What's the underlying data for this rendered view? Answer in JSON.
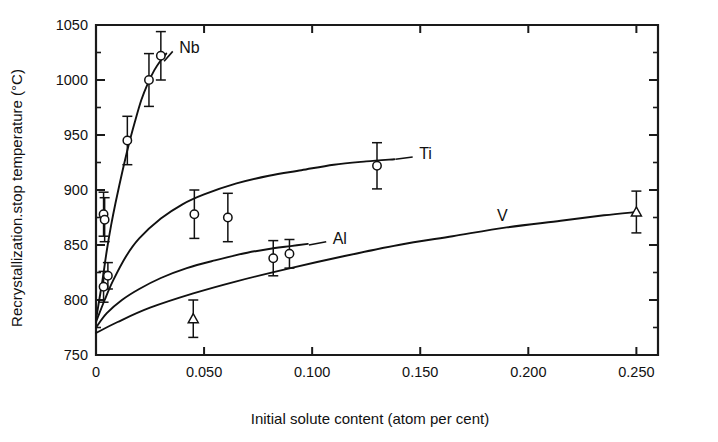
{
  "chart_data": {
    "type": "scatter",
    "title": "",
    "xlabel": "Initial solute content (atom per cent)",
    "ylabel": "Recrystallization.stop temperature (°C)",
    "xlim": [
      0,
      0.26
    ],
    "ylim": [
      750,
      1050
    ],
    "xticks": [
      0,
      0.05,
      0.1,
      0.15,
      0.2,
      0.25
    ],
    "xticklabels": [
      "0",
      "0.050",
      "0.100",
      "0.150",
      "0.200",
      "0.250"
    ],
    "yticks": [
      750,
      800,
      850,
      900,
      950,
      1000,
      1050
    ],
    "yticklabels": [
      "750",
      "800",
      "850",
      "900",
      "950",
      "1000",
      "1050"
    ],
    "grid": false,
    "legend_position": "inline-curve-labels",
    "series": [
      {
        "name": "Nb",
        "marker": "circle",
        "label_x": 0.0385,
        "label_y": 1030,
        "leader": [
          [
            0.0355,
            1026
          ],
          [
            0.0315,
            1017
          ]
        ],
        "curve": [
          [
            0.0,
            782
          ],
          [
            0.0015,
            800
          ],
          [
            0.003,
            818
          ],
          [
            0.005,
            845
          ],
          [
            0.007,
            868
          ],
          [
            0.009,
            888
          ],
          [
            0.012,
            915
          ],
          [
            0.015,
            940
          ],
          [
            0.018,
            962
          ],
          [
            0.021,
            982
          ],
          [
            0.024,
            997
          ],
          [
            0.027,
            1009
          ],
          [
            0.03,
            1018
          ],
          [
            0.0325,
            1024
          ]
        ],
        "points": [
          {
            "x": 0.0035,
            "y": 812,
            "err": 14
          },
          {
            "x": 0.0055,
            "y": 822,
            "err": 12
          },
          {
            "x": 0.0145,
            "y": 945,
            "err": 22
          },
          {
            "x": 0.0245,
            "y": 1000,
            "err": 24
          },
          {
            "x": 0.03,
            "y": 1022,
            "err": 22
          }
        ]
      },
      {
        "name": "Ti",
        "marker": "circle",
        "label_x": 0.1495,
        "label_y": 934,
        "leader": [
          [
            0.1465,
            930
          ],
          [
            0.1385,
            928
          ]
        ],
        "curve": [
          [
            0.0,
            780
          ],
          [
            0.004,
            800
          ],
          [
            0.008,
            818
          ],
          [
            0.014,
            840
          ],
          [
            0.02,
            856
          ],
          [
            0.03,
            874
          ],
          [
            0.04,
            887
          ],
          [
            0.05,
            896
          ],
          [
            0.065,
            906
          ],
          [
            0.08,
            913
          ],
          [
            0.095,
            918
          ],
          [
            0.11,
            923
          ],
          [
            0.125,
            926
          ],
          [
            0.138,
            928
          ]
        ],
        "points": [
          {
            "x": 0.0035,
            "y": 878,
            "err": 20
          },
          {
            "x": 0.004,
            "y": 873,
            "err": 20
          },
          {
            "x": 0.0455,
            "y": 878,
            "err": 22
          },
          {
            "x": 0.061,
            "y": 875,
            "err": 22
          },
          {
            "x": 0.13,
            "y": 922,
            "err": 21
          }
        ]
      },
      {
        "name": "Al",
        "marker": "circle",
        "label_x": 0.1095,
        "label_y": 856,
        "leader": [
          [
            0.1065,
            853
          ],
          [
            0.0985,
            850
          ]
        ],
        "curve": [
          [
            0.0,
            775
          ],
          [
            0.005,
            788
          ],
          [
            0.012,
            800
          ],
          [
            0.02,
            810
          ],
          [
            0.03,
            820
          ],
          [
            0.042,
            829
          ],
          [
            0.055,
            836
          ],
          [
            0.07,
            843
          ],
          [
            0.082,
            847
          ],
          [
            0.09,
            849
          ],
          [
            0.098,
            851
          ]
        ],
        "points": [
          {
            "x": 0.082,
            "y": 838,
            "err": 16
          },
          {
            "x": 0.0895,
            "y": 842,
            "err": 13
          }
        ]
      },
      {
        "name": "V",
        "marker": "triangle",
        "label_x": 0.1855,
        "label_y": 877,
        "leader": null,
        "curve": [
          [
            0.0,
            770
          ],
          [
            0.01,
            780
          ],
          [
            0.025,
            793
          ],
          [
            0.045,
            806
          ],
          [
            0.065,
            817
          ],
          [
            0.09,
            829
          ],
          [
            0.115,
            840
          ],
          [
            0.14,
            850
          ],
          [
            0.165,
            858
          ],
          [
            0.19,
            866
          ],
          [
            0.215,
            872
          ],
          [
            0.235,
            877
          ],
          [
            0.25,
            880
          ]
        ],
        "points": [
          {
            "x": 0.045,
            "y": 783,
            "err": 17
          },
          {
            "x": 0.25,
            "y": 880,
            "err": 19
          }
        ]
      }
    ]
  }
}
